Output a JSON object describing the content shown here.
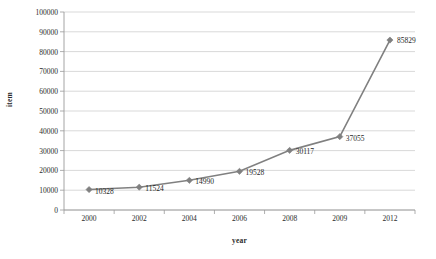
{
  "chart_data": {
    "type": "line",
    "title": "",
    "xlabel": "year",
    "ylabel": "item",
    "categories": [
      "2000",
      "2002",
      "2004",
      "2006",
      "2008",
      "2009",
      "2012"
    ],
    "values": [
      10328,
      11524,
      14990,
      19528,
      30117,
      37055,
      85829
    ],
    "point_labels": [
      "10328",
      "11524",
      "14990",
      "19528",
      "30117",
      "37055",
      "85829"
    ],
    "ylim": [
      0,
      100000
    ],
    "ytick_labels": [
      "100000",
      "90000",
      "80000",
      "70000",
      "60000",
      "50000",
      "40000",
      "30000",
      "20000",
      "10000",
      "0"
    ],
    "ytick_values": [
      100000,
      90000,
      80000,
      70000,
      60000,
      50000,
      40000,
      30000,
      20000,
      10000,
      0
    ],
    "grid": "horizontal",
    "legend": "none",
    "series_color": "#808080",
    "marker": "diamond",
    "gridline_color": "#c8c8c8",
    "axis_color": "#9a9a9a"
  }
}
